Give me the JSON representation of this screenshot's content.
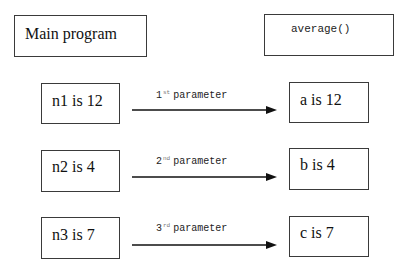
{
  "header": {
    "caller_label": "Main program",
    "callee_label": "average()"
  },
  "rows": [
    {
      "arg": "n1 is 12",
      "ordinal_number": "1",
      "ordinal_suffix": "st",
      "link_label": "parameter",
      "param": "a is 12"
    },
    {
      "arg": "n2 is 4",
      "ordinal_number": "2",
      "ordinal_suffix": "nd",
      "link_label": "parameter",
      "param": "b is 4"
    },
    {
      "arg": "n3 is 7",
      "ordinal_number": "3",
      "ordinal_suffix": "rd",
      "link_label": "parameter",
      "param": "c is 7"
    }
  ],
  "colors": {
    "line": "#111111",
    "border": "#3a3a3a"
  }
}
